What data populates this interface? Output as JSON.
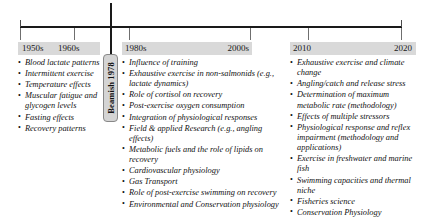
{
  "figure": {
    "type": "timeline",
    "title": "",
    "axis": {
      "orientation": "horizontal",
      "ticks": [
        {
          "label": "",
          "x_px": 20
        },
        {
          "label": "",
          "x_px": 74
        },
        {
          "label": "",
          "x_px": 111
        },
        {
          "label": "",
          "x_px": 129
        },
        {
          "label": "",
          "x_px": 250
        },
        {
          "label": "",
          "x_px": 308
        },
        {
          "label": "",
          "x_px": 401
        }
      ]
    },
    "event_marker": {
      "label": "Beamish 1978",
      "year": 1978,
      "orientation": "vertical",
      "box_fill": "#d4d4d4",
      "box_border": "#888888"
    },
    "band_color": "#d9d9d9",
    "periods": [
      {
        "id": "period-1",
        "decade_labels": [
          "1950s",
          "1960s"
        ],
        "topics": [
          "Blood lactate patterns",
          "Intermittent exercise",
          "Temperature effects",
          "Muscular fatigue and glycogen levels",
          "Fasting effects",
          "Recovery patterns"
        ]
      },
      {
        "id": "period-2",
        "decade_labels": [
          "1980s",
          "2000s"
        ],
        "topics": [
          "Influence of training",
          "Exhaustive exercise in non-salmonids (e.g., lactate dynamics)",
          "Role of cortisol on recovery",
          "Post-exercise oxygen consumption",
          "Integration of physiological responses",
          "Field & applied Research (e.g., angling effects)",
          "Metabolic fuels and the role of lipids on recovery",
          "Cardiovascular physiology",
          "Gas Transport",
          "Role of post-exercise swimming on recovery",
          "Environmental and Conservation physiology"
        ]
      },
      {
        "id": "period-3",
        "decade_labels": [
          "2010",
          "2020"
        ],
        "topics": [
          "Exhaustive exercise and climate change",
          "Angling/catch and release stress",
          "Determination of maximum metabolic rate (methodology)",
          "Effects of multiple stressors",
          "Physiological response and reflex impairment (methodology and applications)",
          "Exercise in freshwater and marine fish",
          "Swimming capacities and thermal niche",
          "Fisheries science",
          "Conservation Physiology"
        ]
      }
    ]
  }
}
